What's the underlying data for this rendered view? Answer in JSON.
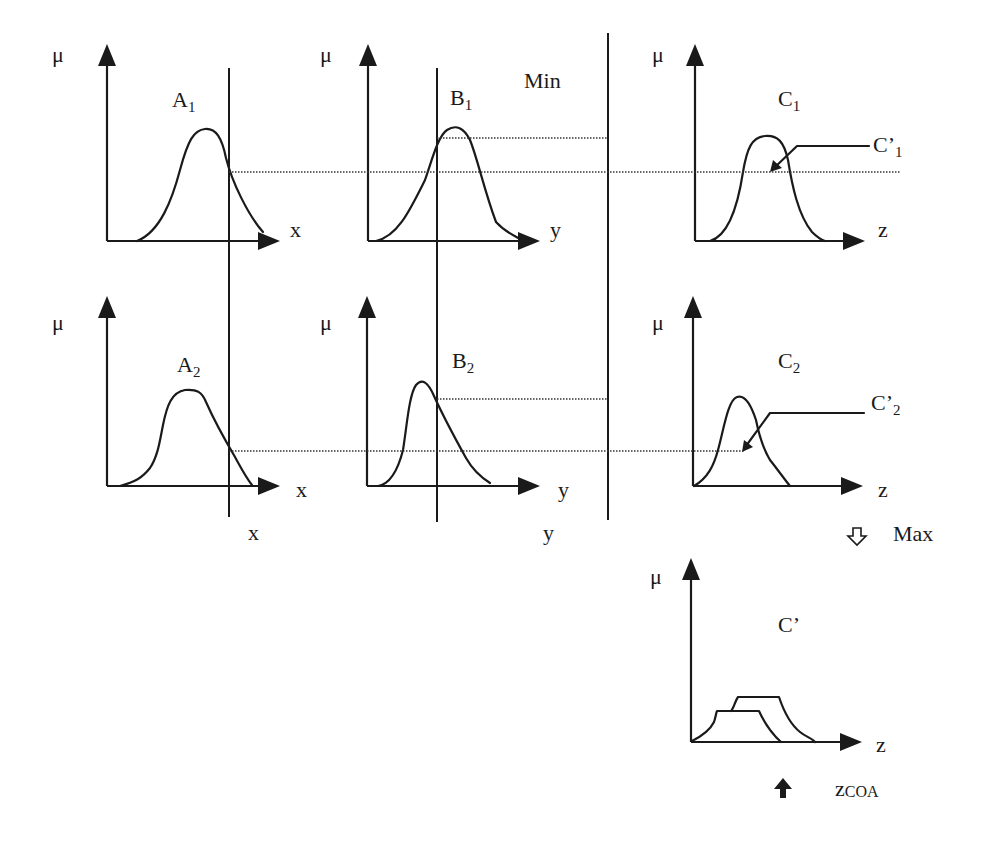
{
  "diagram": {
    "operators": {
      "min": "Min",
      "max": "Max",
      "max_arrow": "⇩"
    },
    "mu": "μ",
    "rows": [
      {
        "A": {
          "name": "A",
          "sub": "1",
          "axis": "x"
        },
        "B": {
          "name": "B",
          "sub": "1",
          "axis": "y"
        },
        "C": {
          "name": "C",
          "sub": "1",
          "axis": "z",
          "clipped": {
            "name": "C’",
            "sub": "1"
          }
        }
      },
      {
        "A": {
          "name": "A",
          "sub": "2",
          "axis": "x"
        },
        "B": {
          "name": "B",
          "sub": "2",
          "axis": "y"
        },
        "C": {
          "name": "C",
          "sub": "2",
          "axis": "z",
          "clipped": {
            "name": "C’",
            "sub": "2"
          }
        }
      }
    ],
    "inputs": {
      "x": "x",
      "y": "y"
    },
    "output": {
      "name": "C’",
      "axis": "z",
      "defuzz": {
        "label": "z",
        "sub": "COA"
      }
    }
  }
}
